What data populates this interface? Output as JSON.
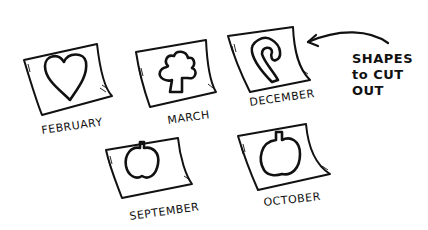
{
  "annotation": {
    "line1": "SHAPES",
    "line2": "to CUT",
    "line3": "OUT",
    "arrow": "curved-arrow-pointing-left"
  },
  "cards": [
    {
      "label": "FEBRUARY",
      "shape": "heart"
    },
    {
      "label": "MARCH",
      "shape": "shamrock"
    },
    {
      "label": "DECEMBER",
      "shape": "candy-cane"
    },
    {
      "label": "SEPTEMBER",
      "shape": "apple-pumpkin"
    },
    {
      "label": "OCTOBER",
      "shape": "pumpkin"
    }
  ],
  "colors": {
    "ink": "#111111",
    "paper": "#ffffff"
  }
}
